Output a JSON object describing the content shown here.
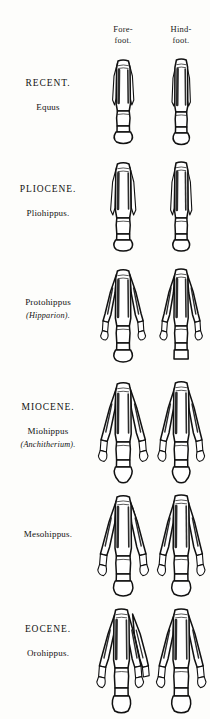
{
  "plate": {
    "title": "Evolution of the horse foot",
    "background_color": "#fdfdfb",
    "ink_color": "#111111"
  },
  "columns": [
    {
      "id": "forefoot",
      "line1": "Fore-",
      "line2": "foot."
    },
    {
      "id": "hindfoot",
      "line1": "Hind-",
      "line2": "foot."
    }
  ],
  "rows": [
    {
      "id": "recent-equus",
      "epoch": "RECENT.",
      "genus": "Equus",
      "genus_alt": "",
      "toes_forefoot": 1,
      "toes_hindfoot": 1,
      "splints": 2
    },
    {
      "id": "pliocene-pliohippus",
      "epoch": "PLIOCENE.",
      "genus": "Pliohippus.",
      "genus_alt": "",
      "toes_forefoot": 1,
      "toes_hindfoot": 1,
      "splints": 2
    },
    {
      "id": "pliocene-protohippus",
      "epoch": "",
      "genus": "Protohippus",
      "genus_alt": "(Hipparion).",
      "toes_forefoot": 3,
      "toes_hindfoot": 3,
      "splints": 0
    },
    {
      "id": "miocene-miohippus",
      "epoch": "MIOCENE.",
      "genus": "Miohippus",
      "genus_alt": "(Anchitherium).",
      "toes_forefoot": 3,
      "toes_hindfoot": 3,
      "splints": 0
    },
    {
      "id": "miocene-mesohippus",
      "epoch": "",
      "genus": "Mesohippus.",
      "genus_alt": "",
      "toes_forefoot": 3,
      "toes_hindfoot": 3,
      "splints": 1
    },
    {
      "id": "eocene-orohippus",
      "epoch": "EOCENE.",
      "genus": "Orohippus.",
      "genus_alt": "",
      "toes_forefoot": 4,
      "toes_hindfoot": 3,
      "splints": 0
    }
  ]
}
